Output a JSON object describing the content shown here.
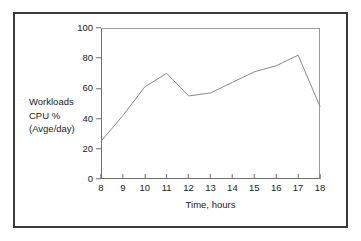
{
  "chart_data": {
    "type": "line",
    "title": "",
    "xlabel": "Time, hours",
    "ylabel_lines": [
      "Workloads",
      "CPU %",
      "(Avge/day)"
    ],
    "x": [
      8,
      9,
      10,
      11,
      12,
      13,
      14,
      15,
      16,
      17,
      18
    ],
    "values": [
      25,
      42,
      61,
      70,
      55,
      57,
      64,
      71,
      75,
      82,
      48
    ],
    "series": [
      {
        "name": "Workloads CPU % (Avge/day)",
        "values": [
          25,
          42,
          61,
          70,
          55,
          57,
          64,
          71,
          75,
          82,
          48
        ]
      }
    ],
    "xlim": [
      8,
      18
    ],
    "ylim": [
      0,
      100
    ],
    "xticks": [
      "8",
      "9",
      "10",
      "11",
      "12",
      "13",
      "14",
      "15",
      "16",
      "17",
      "18"
    ],
    "yticks": [
      "0",
      "20",
      "40",
      "60",
      "80",
      "100"
    ],
    "ytick_values": [
      0,
      20,
      40,
      60,
      80,
      100
    ],
    "grid": false,
    "legend": "none",
    "line_color": "#8a8a8a",
    "axis_color": "#6f6f6f",
    "frame_color": "#3b3b42",
    "text_color": "#1c1c1c",
    "background": "#ffffff"
  }
}
